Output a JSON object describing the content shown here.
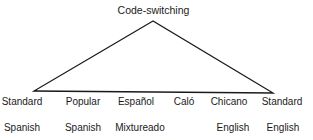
{
  "diagram": {
    "title": "Code-switching",
    "triangle": {
      "apex": [
        153,
        21
      ],
      "left": [
        34,
        91
      ],
      "right": [
        273,
        93
      ],
      "stroke_color": "#1a1a1a"
    },
    "varieties": [
      {
        "line1": "Standard",
        "line2": "Spanish",
        "x": 22
      },
      {
        "line1": "Popular",
        "line2": "Spanish",
        "x": 83
      },
      {
        "line1": "Español",
        "line2": "Mixtureado",
        "x": 136
      },
      {
        "line1": "Caló",
        "line2": "",
        "x": 184
      },
      {
        "line1": "Chicano",
        "line2": "English",
        "x": 229
      },
      {
        "line1": "Standard",
        "line2": "English",
        "x": 282
      }
    ]
  }
}
